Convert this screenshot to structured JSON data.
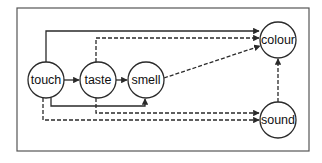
{
  "diagram": {
    "type": "directed-graph",
    "colors": {
      "stroke": "#2a2a2a",
      "frame": "#555555",
      "background": "#ffffff"
    },
    "nodes": [
      {
        "id": "touch",
        "label": "touch",
        "cx": 46,
        "cy": 80,
        "r": 18
      },
      {
        "id": "taste",
        "label": "taste",
        "cx": 98,
        "cy": 80,
        "r": 18
      },
      {
        "id": "smell",
        "label": "smell",
        "cx": 146,
        "cy": 80,
        "r": 18
      },
      {
        "id": "colour",
        "label": "colour",
        "cx": 278,
        "cy": 40,
        "r": 18
      },
      {
        "id": "sound",
        "label": "sound",
        "cx": 278,
        "cy": 120,
        "r": 18
      }
    ],
    "edges": [
      {
        "from": "touch",
        "to": "taste",
        "style": "solid"
      },
      {
        "from": "taste",
        "to": "smell",
        "style": "solid"
      },
      {
        "from": "touch",
        "to": "colour",
        "style": "solid"
      },
      {
        "from": "taste",
        "to": "colour",
        "style": "dashed"
      },
      {
        "from": "smell",
        "to": "colour",
        "style": "dashed"
      },
      {
        "from": "touch",
        "to": "smell",
        "style": "solid"
      },
      {
        "from": "taste",
        "to": "sound",
        "style": "dashed"
      },
      {
        "from": "touch",
        "to": "sound",
        "style": "dashed"
      },
      {
        "from": "sound",
        "to": "colour",
        "style": "dashed"
      }
    ]
  }
}
